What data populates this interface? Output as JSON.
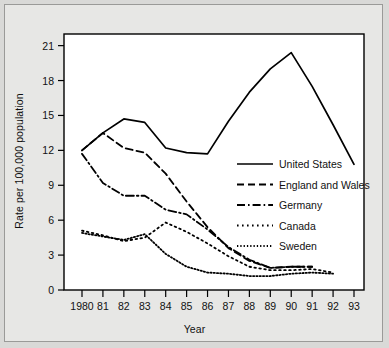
{
  "chart_data": {
    "type": "line",
    "title": "",
    "xlabel": "Year",
    "ylabel": "Rate per 100,000 population",
    "x": [
      1980,
      1981,
      1982,
      1983,
      1984,
      1985,
      1986,
      1987,
      1988,
      1989,
      1990,
      1991,
      1992,
      1993
    ],
    "xtick_labels": [
      "1980",
      "81",
      "82",
      "83",
      "84",
      "85",
      "86",
      "87",
      "88",
      "89",
      "90",
      "91",
      "92",
      "93"
    ],
    "ytick_labels": [
      "0",
      "3",
      "6",
      "9",
      "12",
      "15",
      "18",
      "21"
    ],
    "yticks": [
      0,
      3,
      6,
      9,
      12,
      15,
      18,
      21
    ],
    "ylim": [
      0,
      22
    ],
    "xlim": [
      1980,
      1993
    ],
    "grid": false,
    "legend_position": "center-right-inside",
    "series": [
      {
        "name": "United States",
        "style": "solid",
        "x": [
          1980,
          1981,
          1982,
          1983,
          1984,
          1985,
          1986,
          1987,
          1988,
          1989,
          1990,
          1991,
          1992,
          1993
        ],
        "values": [
          12.0,
          13.5,
          14.7,
          14.4,
          12.2,
          11.8,
          11.7,
          14.5,
          17.0,
          19.0,
          20.4,
          17.5,
          14.2,
          10.8
        ]
      },
      {
        "name": "England and Wales",
        "style": "dashed",
        "x": [
          1980,
          1981,
          1982,
          1983,
          1984,
          1985,
          1986,
          1987,
          1988,
          1989,
          1990,
          1991
        ],
        "values": [
          12.0,
          13.5,
          12.2,
          11.8,
          10.0,
          7.6,
          5.4,
          3.6,
          2.5,
          1.9,
          2.0,
          2.0
        ]
      },
      {
        "name": "Germany",
        "style": "dash-dot",
        "x": [
          1980,
          1981,
          1982,
          1983,
          1984,
          1985,
          1986,
          1987,
          1988,
          1989,
          1990,
          1991
        ],
        "values": [
          11.7,
          9.2,
          8.1,
          8.1,
          6.9,
          6.5,
          5.2,
          3.7,
          2.6,
          1.9,
          2.0,
          2.0
        ]
      },
      {
        "name": "Canada",
        "style": "dotted-wide",
        "x": [
          1980,
          1981,
          1982,
          1983,
          1984,
          1985,
          1986,
          1987,
          1988,
          1989,
          1990,
          1991,
          1992
        ],
        "values": [
          5.1,
          4.7,
          4.2,
          4.5,
          5.8,
          5.0,
          4.0,
          2.9,
          2.0,
          1.7,
          1.7,
          1.8,
          1.5
        ]
      },
      {
        "name": "Sweden",
        "style": "dotted-fine",
        "x": [
          1980,
          1981,
          1982,
          1983,
          1984,
          1985,
          1986,
          1987,
          1988,
          1989,
          1990,
          1991,
          1992
        ],
        "values": [
          4.9,
          4.6,
          4.3,
          4.8,
          3.1,
          2.0,
          1.5,
          1.4,
          1.2,
          1.2,
          1.4,
          1.5,
          1.4
        ]
      }
    ]
  }
}
